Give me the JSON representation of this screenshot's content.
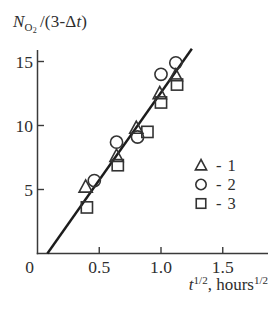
{
  "figure": {
    "background": "#ffffff",
    "ink_color": "#3a3a3a",
    "line_color": "#1c1c1c"
  },
  "ylabel": {
    "symbol": "N",
    "sub_main": "O",
    "sub_sub": "2",
    "middle": "/(3-Δ",
    "var_t": "t",
    "close": ")"
  },
  "xlabel": {
    "var_t": "t",
    "sup_a": "1/2",
    "middle": ", hours",
    "sup_b": "1/2"
  },
  "chart_data": {
    "type": "scatter",
    "title": "",
    "xlabel": "t^(1/2), hours^(1/2)",
    "ylabel": "N_O2 / (3 - Δt)",
    "xlim": [
      0,
      1.85
    ],
    "ylim": [
      0,
      16.2
    ],
    "grid": false,
    "legend_position": "right-middle",
    "x_ticks": {
      "values": [
        0,
        0.5,
        1.0,
        1.5
      ],
      "labels": [
        "0",
        "0.5",
        "1.0",
        "1.5"
      ]
    },
    "y_ticks": {
      "values": [
        5,
        10,
        15
      ],
      "labels": [
        "5",
        "10",
        "15"
      ]
    },
    "series": [
      {
        "name": "1",
        "marker": "triangle",
        "legend_label": "- 1",
        "points": [
          [
            0.39,
            5.2
          ],
          [
            0.64,
            7.6
          ],
          [
            0.8,
            9.8
          ],
          [
            0.99,
            12.5
          ],
          [
            1.12,
            13.9
          ]
        ]
      },
      {
        "name": "2",
        "marker": "circle",
        "legend_label": "- 2",
        "points": [
          [
            0.46,
            5.7
          ],
          [
            0.64,
            8.7
          ],
          [
            0.81,
            9.1
          ],
          [
            1.0,
            14.0
          ],
          [
            1.12,
            14.9
          ]
        ]
      },
      {
        "name": "3",
        "marker": "square",
        "legend_label": "- 3",
        "points": [
          [
            0.4,
            3.6
          ],
          [
            0.65,
            6.9
          ],
          [
            0.89,
            9.5
          ],
          [
            1.0,
            11.8
          ],
          [
            1.13,
            13.2
          ]
        ]
      }
    ],
    "fit_line": {
      "x1": 0.08,
      "y1": 0,
      "x2": 1.25,
      "y2": 16.0
    }
  }
}
